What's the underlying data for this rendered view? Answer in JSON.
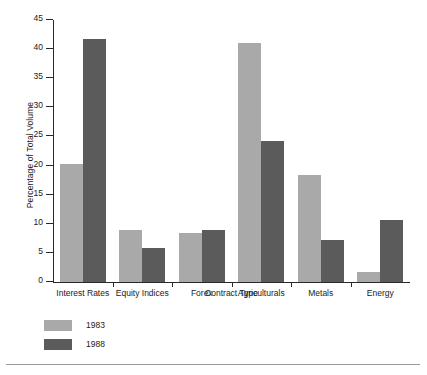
{
  "chart_data": {
    "type": "bar",
    "title": "",
    "xlabel": "Contract Type",
    "ylabel": "Percentage of Total Volume",
    "categories": [
      "Interest Rates",
      "Equity Indices",
      "Forex",
      "Agriculturals",
      "Metals",
      "Energy"
    ],
    "series": [
      {
        "name": "1983",
        "color": "#a9a9a9",
        "values": [
          20.2,
          9.0,
          8.5,
          41.0,
          18.3,
          1.8
        ]
      },
      {
        "name": "1988",
        "color": "#5b5b5b",
        "values": [
          41.7,
          5.9,
          8.9,
          24.3,
          7.3,
          10.7
        ]
      }
    ],
    "ylim": [
      0,
      45
    ],
    "yticks": [
      0,
      5,
      10,
      15,
      20,
      25,
      30,
      35,
      40,
      45
    ],
    "ytick_labels": [
      "0",
      "5",
      "10",
      "15",
      "20",
      "25",
      "30",
      "35",
      "40",
      "45"
    ],
    "grid": false,
    "legend_position": "bottom-left"
  }
}
